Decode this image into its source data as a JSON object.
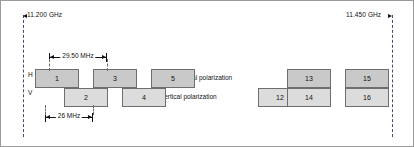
{
  "diagram": {
    "band_edges": {
      "left": {
        "label": "11.200 GHz",
        "arrow": "arrow-left"
      },
      "right": {
        "label": "11.450 GHz",
        "arrow": "arrow-right"
      }
    },
    "axis_labels": {
      "horizontal_short": "H",
      "vertical_short": "V"
    },
    "captions": {
      "horizontal": "horizontal polarization",
      "vertical": "vertical polarization"
    },
    "dimensions": [
      {
        "id": "channel-spacing",
        "label": "29.50 MHz"
      },
      {
        "id": "channel-bandwidth",
        "label": "26 MHz"
      }
    ],
    "colors": {
      "box_h_fill": "#c9c9c9",
      "box_v_fill": "#dcdcdc",
      "box_stroke": "#6e6e6e",
      "guide_line": "#4a4a6a",
      "frame": "#9a9a9a",
      "text": "#111111"
    },
    "channels": [
      {
        "label": "1",
        "polarization": "H",
        "left": 34,
        "width": 44
      },
      {
        "label": "2",
        "polarization": "V",
        "left": 63,
        "width": 44
      },
      {
        "label": "3",
        "polarization": "H",
        "left": 92,
        "width": 44
      },
      {
        "label": "4",
        "polarization": "V",
        "left": 121,
        "width": 44
      },
      {
        "label": "5",
        "polarization": "H",
        "left": 150,
        "width": 44
      },
      {
        "label": "12",
        "polarization": "V",
        "left": 257,
        "width": 44
      },
      {
        "label": "13",
        "polarization": "H",
        "left": 286,
        "width": 44
      },
      {
        "label": "14",
        "polarization": "V",
        "left": 286,
        "width": 44
      },
      {
        "label": "15",
        "polarization": "H",
        "left": 344,
        "width": 44
      },
      {
        "label": "16",
        "polarization": "V",
        "left": 344,
        "width": 44
      }
    ]
  }
}
